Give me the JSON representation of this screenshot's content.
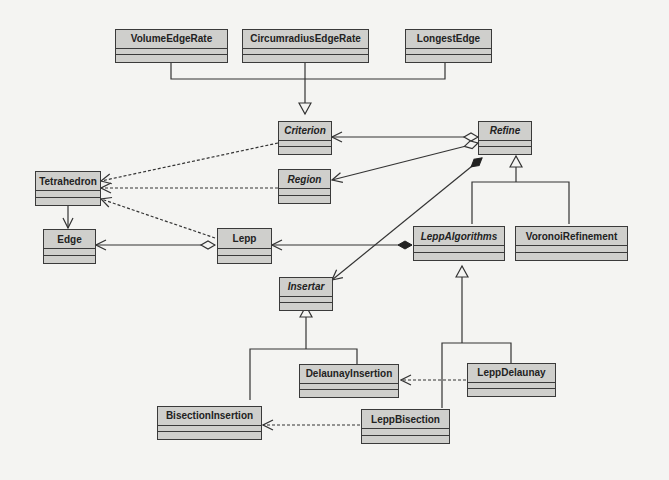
{
  "diagram": {
    "type": "UML class diagram",
    "classes": [
      {
        "id": "VolumeEdgeRate",
        "label": "VolumeEdgeRate",
        "abstract": false
      },
      {
        "id": "CircumradiusEdgeRate",
        "label": "CircumradiusEdgeRate",
        "abstract": false
      },
      {
        "id": "LongestEdge",
        "label": "LongestEdge",
        "abstract": false
      },
      {
        "id": "Criterion",
        "label": "Criterion",
        "abstract": true
      },
      {
        "id": "Refine",
        "label": "Refine",
        "abstract": true
      },
      {
        "id": "Tetrahedron",
        "label": "Tetrahedron",
        "abstract": false
      },
      {
        "id": "Region",
        "label": "Region",
        "abstract": true
      },
      {
        "id": "Edge",
        "label": "Edge",
        "abstract": false
      },
      {
        "id": "Lepp",
        "label": "Lepp",
        "abstract": false
      },
      {
        "id": "LeppAlgorithms",
        "label": "LeppAlgorithms",
        "abstract": true
      },
      {
        "id": "VoronoiRefinement",
        "label": "VoronoiRefinement",
        "abstract": false
      },
      {
        "id": "Insertar",
        "label": "Insertar",
        "abstract": true
      },
      {
        "id": "DelaunayInsertion",
        "label": "DelaunayInsertion",
        "abstract": false
      },
      {
        "id": "LeppDelaunay",
        "label": "LeppDelaunay",
        "abstract": false
      },
      {
        "id": "BisectionInsertion",
        "label": "BisectionInsertion",
        "abstract": false
      },
      {
        "id": "LeppBisection",
        "label": "LeppBisection",
        "abstract": false
      }
    ],
    "relations": [
      {
        "from": "VolumeEdgeRate",
        "to": "Criterion",
        "kind": "generalization"
      },
      {
        "from": "CircumradiusEdgeRate",
        "to": "Criterion",
        "kind": "generalization"
      },
      {
        "from": "LongestEdge",
        "to": "Criterion",
        "kind": "generalization"
      },
      {
        "from": "Refine",
        "to": "Criterion",
        "kind": "aggregation"
      },
      {
        "from": "Refine",
        "to": "Region",
        "kind": "aggregation"
      },
      {
        "from": "Refine",
        "to": "Insertar",
        "kind": "composition"
      },
      {
        "from": "Criterion",
        "to": "Tetrahedron",
        "kind": "dependency"
      },
      {
        "from": "Region",
        "to": "Tetrahedron",
        "kind": "dependency"
      },
      {
        "from": "Lepp",
        "to": "Tetrahedron",
        "kind": "dependency"
      },
      {
        "from": "Tetrahedron",
        "to": "Edge",
        "kind": "association"
      },
      {
        "from": "Lepp",
        "to": "Edge",
        "kind": "aggregation"
      },
      {
        "from": "LeppAlgorithms",
        "to": "Lepp",
        "kind": "composition"
      },
      {
        "from": "LeppAlgorithms",
        "to": "Refine",
        "kind": "generalization"
      },
      {
        "from": "VoronoiRefinement",
        "to": "Refine",
        "kind": "generalization"
      },
      {
        "from": "DelaunayInsertion",
        "to": "Insertar",
        "kind": "generalization"
      },
      {
        "from": "BisectionInsertion",
        "to": "Insertar",
        "kind": "generalization"
      },
      {
        "from": "LeppDelaunay",
        "to": "LeppAlgorithms",
        "kind": "generalization"
      },
      {
        "from": "LeppBisection",
        "to": "LeppAlgorithms",
        "kind": "generalization"
      },
      {
        "from": "LeppDelaunay",
        "to": "DelaunayInsertion",
        "kind": "dependency"
      },
      {
        "from": "LeppBisection",
        "to": "BisectionInsertion",
        "kind": "dependency"
      }
    ]
  }
}
